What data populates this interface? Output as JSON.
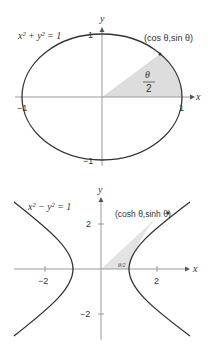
{
  "top_figure": {
    "equation": "x² + y² = 1",
    "point_label": "(cos θ,sin θ)",
    "area_label_num": "θ",
    "area_label_den": "2",
    "axis_x": "x",
    "axis_y": "y",
    "ticks": {
      "x_pos": "1",
      "x_neg": "−1",
      "y_pos": "1",
      "y_neg": "−1"
    }
  },
  "bottom_figure": {
    "equation": "x² − y² = 1",
    "point_label": "(cosh θ,sinh θ)",
    "area_label": "θ/2",
    "axis_x": "x",
    "axis_y": "y",
    "ticks": {
      "x_pos": "2",
      "x_neg": "−2",
      "y_pos": "2",
      "y_neg": "−2"
    }
  },
  "colors": {
    "curve": "#333333",
    "axis": "#999999",
    "shade": "#dddddd"
  }
}
